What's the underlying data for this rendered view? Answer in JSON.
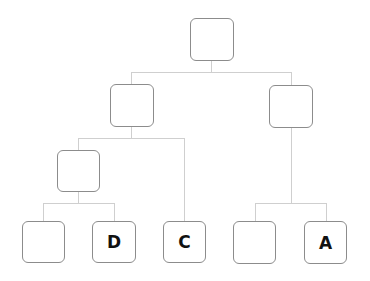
{
  "diagram": {
    "type": "tree",
    "colors": {
      "box_border": "#8c8c8c",
      "connector": "#cfcfcf",
      "label": "#111111"
    },
    "nodes": [
      {
        "id": "root",
        "label": "",
        "x": 190,
        "y": 18
      },
      {
        "id": "left",
        "label": "",
        "x": 110,
        "y": 84
      },
      {
        "id": "right",
        "label": "",
        "x": 269,
        "y": 85
      },
      {
        "id": "left-left",
        "label": "",
        "x": 57,
        "y": 150
      },
      {
        "id": "leaf-1",
        "label": "",
        "x": 22,
        "y": 221
      },
      {
        "id": "leaf-2",
        "label": "D",
        "x": 92,
        "y": 221
      },
      {
        "id": "leaf-3",
        "label": "C",
        "x": 163,
        "y": 221
      },
      {
        "id": "leaf-4",
        "label": "",
        "x": 233,
        "y": 221
      },
      {
        "id": "leaf-5",
        "label": "A",
        "x": 304,
        "y": 221
      }
    ],
    "edges": [
      [
        "root",
        "left"
      ],
      [
        "root",
        "right"
      ],
      [
        "left",
        "left-left"
      ],
      [
        "left",
        "leaf-3"
      ],
      [
        "left-left",
        "leaf-1"
      ],
      [
        "left-left",
        "leaf-2"
      ],
      [
        "right",
        "leaf-4"
      ],
      [
        "right",
        "leaf-5"
      ]
    ]
  }
}
